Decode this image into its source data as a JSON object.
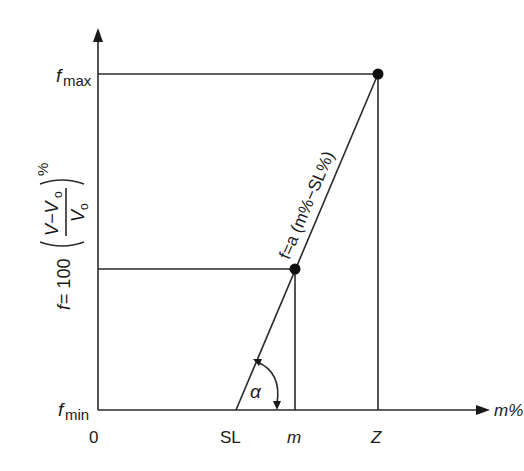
{
  "diagram": {
    "type": "line-diagram",
    "y_axis": {
      "label_prefix": "f",
      "label_eq": "= 100",
      "frac_numerator": "V−V",
      "frac_numerator_sub": "o",
      "frac_denominator": "V",
      "frac_denominator_sub": "o",
      "percent": "%",
      "tick_max_base": "f",
      "tick_max_sub": "max",
      "tick_min_base": "f",
      "tick_min_sub": "min"
    },
    "x_axis": {
      "label": "m%",
      "ticks": [
        "0",
        "SL",
        "m",
        "Z"
      ]
    },
    "line_label": "f=a (m%−SL%)",
    "angle_label": "α",
    "points": [
      {
        "name": "m-point",
        "x_label": "m",
        "y_label": "f"
      },
      {
        "name": "z-point",
        "x_label": "Z",
        "y_label": "fmax"
      }
    ]
  }
}
